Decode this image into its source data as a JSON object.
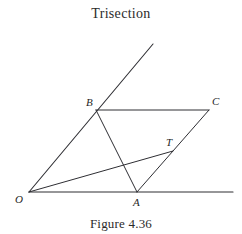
{
  "figure": {
    "title": "Trisection",
    "caption": "Figure 4.36",
    "stroke_color": "#2e2e33",
    "background_color": "#ffffff",
    "text_color": "#2b2b2b"
  },
  "vertices": [
    {
      "id": "O",
      "label": "O",
      "x": 29,
      "y": 192,
      "label_x": 15,
      "label_y": 194
    },
    {
      "id": "A",
      "label": "A",
      "x": 137,
      "y": 192,
      "label_x": 133,
      "label_y": 197
    },
    {
      "id": "B",
      "label": "B",
      "x": 96,
      "y": 110,
      "label_x": 86,
      "label_y": 97
    },
    {
      "id": "C",
      "label": "C",
      "x": 209,
      "y": 110,
      "label_x": 212,
      "label_y": 96
    },
    {
      "id": "T",
      "label": "T",
      "x": 172,
      "y": 152,
      "label_x": 166,
      "label_y": 137
    }
  ],
  "segments": [
    {
      "name": "ray-O-through-B",
      "from": "O",
      "to_x": 153,
      "to_y": 44,
      "from_x": 29,
      "from_y": 192,
      "width": 1.1
    },
    {
      "name": "base-ray-O-right",
      "from": "O",
      "to_x": 233,
      "to_y": 192,
      "from_x": 29,
      "from_y": 192,
      "width": 1.1
    },
    {
      "name": "segment-B-C",
      "from": "B",
      "to_x": 209,
      "to_y": 110,
      "from_x": 96,
      "from_y": 110,
      "width": 1.0
    },
    {
      "name": "segment-B-A",
      "from": "B",
      "to_x": 137,
      "to_y": 192,
      "from_x": 96,
      "from_y": 110,
      "width": 1.0
    },
    {
      "name": "segment-A-C",
      "from": "A",
      "to_x": 209,
      "to_y": 110,
      "from_x": 137,
      "from_y": 192,
      "width": 1.0
    },
    {
      "name": "segment-O-T",
      "from": "O",
      "to_x": 173,
      "to_y": 151,
      "from_x": 29,
      "from_y": 192,
      "width": 1.0
    }
  ]
}
